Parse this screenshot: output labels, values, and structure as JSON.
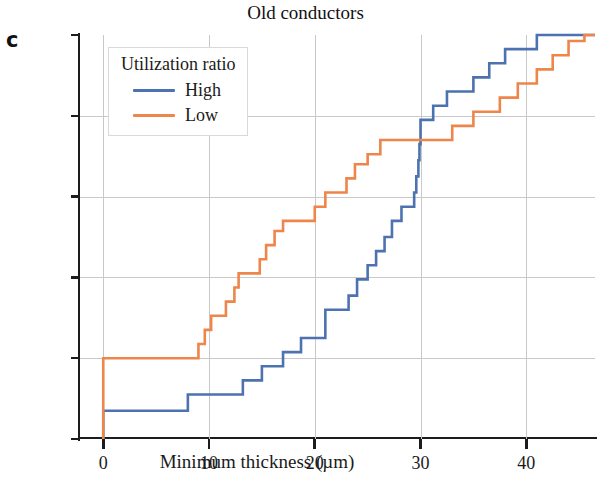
{
  "panel": {
    "label": "c"
  },
  "chart_data": {
    "type": "line",
    "subtype": "step-ecdf",
    "title": "Old conductors",
    "xlabel": "Minimum thickness (µm)",
    "ylabel": "Proportion",
    "xlim": [
      -2.2,
      46.5
    ],
    "ylim": [
      0.0,
      1.0
    ],
    "grid": true,
    "xticks": [
      0,
      10,
      20,
      30,
      40
    ],
    "xtick_labels": [
      "0",
      "10",
      "20",
      "30",
      "40"
    ],
    "yticks": [
      0.0,
      0.2,
      0.4,
      0.6,
      0.8,
      1.0
    ],
    "ytick_labels": [
      "0,0",
      "0,2",
      "0,4",
      "0,6",
      "0,8",
      "1,0"
    ],
    "legend": {
      "title": "Utilization ratio",
      "position": "upper left",
      "entries": [
        {
          "name": "High",
          "color": "#4c72b0"
        },
        {
          "name": "Low",
          "color": "#ee854a"
        }
      ]
    },
    "series": [
      {
        "name": "High",
        "color": "#4c72b0",
        "points": [
          [
            0.0,
            0.0
          ],
          [
            0.0,
            0.07
          ],
          [
            8.0,
            0.07
          ],
          [
            8.0,
            0.11
          ],
          [
            13.2,
            0.11
          ],
          [
            13.2,
            0.145
          ],
          [
            15.0,
            0.145
          ],
          [
            15.0,
            0.18
          ],
          [
            17.0,
            0.18
          ],
          [
            17.0,
            0.215
          ],
          [
            18.7,
            0.215
          ],
          [
            18.7,
            0.25
          ],
          [
            21.0,
            0.25
          ],
          [
            21.0,
            0.32
          ],
          [
            23.2,
            0.32
          ],
          [
            23.2,
            0.355
          ],
          [
            24.0,
            0.355
          ],
          [
            24.0,
            0.395
          ],
          [
            25.0,
            0.395
          ],
          [
            25.0,
            0.43
          ],
          [
            25.8,
            0.43
          ],
          [
            25.8,
            0.465
          ],
          [
            26.6,
            0.465
          ],
          [
            26.6,
            0.5
          ],
          [
            27.3,
            0.5
          ],
          [
            27.3,
            0.54
          ],
          [
            28.2,
            0.54
          ],
          [
            28.2,
            0.575
          ],
          [
            29.4,
            0.575
          ],
          [
            29.4,
            0.61
          ],
          [
            29.6,
            0.61
          ],
          [
            29.6,
            0.65
          ],
          [
            29.8,
            0.65
          ],
          [
            29.8,
            0.69
          ],
          [
            29.9,
            0.69
          ],
          [
            29.9,
            0.73
          ],
          [
            30.0,
            0.73
          ],
          [
            30.0,
            0.79
          ],
          [
            31.2,
            0.79
          ],
          [
            31.2,
            0.825
          ],
          [
            32.5,
            0.825
          ],
          [
            32.5,
            0.86
          ],
          [
            35.0,
            0.86
          ],
          [
            35.0,
            0.895
          ],
          [
            36.5,
            0.895
          ],
          [
            36.5,
            0.93
          ],
          [
            38.0,
            0.93
          ],
          [
            38.0,
            0.965
          ],
          [
            41.0,
            0.965
          ],
          [
            41.0,
            1.0
          ],
          [
            46.5,
            1.0
          ]
        ]
      },
      {
        "name": "Low",
        "color": "#ee854a",
        "points": [
          [
            0.0,
            0.0
          ],
          [
            0.0,
            0.2
          ],
          [
            9.0,
            0.2
          ],
          [
            9.0,
            0.235
          ],
          [
            9.6,
            0.235
          ],
          [
            9.6,
            0.27
          ],
          [
            10.2,
            0.27
          ],
          [
            10.2,
            0.305
          ],
          [
            11.6,
            0.305
          ],
          [
            11.6,
            0.34
          ],
          [
            12.4,
            0.34
          ],
          [
            12.4,
            0.375
          ],
          [
            12.8,
            0.375
          ],
          [
            12.8,
            0.41
          ],
          [
            14.8,
            0.41
          ],
          [
            14.8,
            0.445
          ],
          [
            15.4,
            0.445
          ],
          [
            15.4,
            0.48
          ],
          [
            16.2,
            0.48
          ],
          [
            16.2,
            0.515
          ],
          [
            17.0,
            0.515
          ],
          [
            17.0,
            0.54
          ],
          [
            20.0,
            0.54
          ],
          [
            20.0,
            0.575
          ],
          [
            21.0,
            0.575
          ],
          [
            21.0,
            0.61
          ],
          [
            23.0,
            0.61
          ],
          [
            23.0,
            0.645
          ],
          [
            23.8,
            0.645
          ],
          [
            23.8,
            0.68
          ],
          [
            25.0,
            0.68
          ],
          [
            25.0,
            0.705
          ],
          [
            26.2,
            0.705
          ],
          [
            26.2,
            0.74
          ],
          [
            33.0,
            0.74
          ],
          [
            33.0,
            0.775
          ],
          [
            35.0,
            0.775
          ],
          [
            35.0,
            0.81
          ],
          [
            37.5,
            0.81
          ],
          [
            37.5,
            0.845
          ],
          [
            39.2,
            0.845
          ],
          [
            39.2,
            0.88
          ],
          [
            41.0,
            0.88
          ],
          [
            41.0,
            0.915
          ],
          [
            42.5,
            0.915
          ],
          [
            42.5,
            0.95
          ],
          [
            44.0,
            0.95
          ],
          [
            44.0,
            0.985
          ],
          [
            45.5,
            0.985
          ],
          [
            45.5,
            1.0
          ],
          [
            46.5,
            1.0
          ]
        ]
      }
    ]
  }
}
